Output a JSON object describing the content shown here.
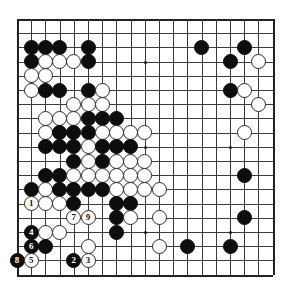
{
  "app": {
    "title": "Go Board Diagram",
    "board_size": 19,
    "colors": {
      "black": "#0d0d0d",
      "white": "#ffffff",
      "line": "#3b3b3b",
      "background": "#ffffff"
    }
  },
  "board": {
    "origin_x": 7,
    "origin_y": 7,
    "spacing": 14.2,
    "columns": 19,
    "rows": 19,
    "star_points": [
      {
        "col": 4,
        "row": 4
      },
      {
        "col": 10,
        "row": 4
      },
      {
        "col": 16,
        "row": 4
      },
      {
        "col": 4,
        "row": 10
      },
      {
        "col": 10,
        "row": 10
      },
      {
        "col": 16,
        "row": 10
      },
      {
        "col": 4,
        "row": 16
      },
      {
        "col": 10,
        "row": 16
      },
      {
        "col": 16,
        "row": 16
      }
    ]
  },
  "stones": [
    {
      "col": 2,
      "row": 3,
      "color": "black",
      "label": ""
    },
    {
      "col": 3,
      "row": 3,
      "color": "black",
      "label": ""
    },
    {
      "col": 4,
      "row": 3,
      "color": "black",
      "label": ""
    },
    {
      "col": 6,
      "row": 3,
      "color": "black",
      "label": ""
    },
    {
      "col": 14,
      "row": 3,
      "color": "black",
      "label": ""
    },
    {
      "col": 17,
      "row": 3,
      "color": "black",
      "label": ""
    },
    {
      "col": 2,
      "row": 4,
      "color": "black",
      "label": ""
    },
    {
      "col": 3,
      "row": 4,
      "color": "white",
      "label": ""
    },
    {
      "col": 4,
      "row": 4,
      "color": "white",
      "label": ""
    },
    {
      "col": 5,
      "row": 4,
      "color": "white",
      "label": ""
    },
    {
      "col": 6,
      "row": 4,
      "color": "black",
      "label": ""
    },
    {
      "col": 16,
      "row": 4,
      "color": "black",
      "label": ""
    },
    {
      "col": 18,
      "row": 4,
      "color": "white",
      "label": ""
    },
    {
      "col": 2,
      "row": 5,
      "color": "white",
      "label": ""
    },
    {
      "col": 3,
      "row": 5,
      "color": "white",
      "label": ""
    },
    {
      "col": 2,
      "row": 6,
      "color": "white",
      "label": ""
    },
    {
      "col": 3,
      "row": 6,
      "color": "black",
      "label": ""
    },
    {
      "col": 4,
      "row": 6,
      "color": "black",
      "label": ""
    },
    {
      "col": 6,
      "row": 6,
      "color": "black",
      "label": ""
    },
    {
      "col": 7,
      "row": 6,
      "color": "white",
      "label": ""
    },
    {
      "col": 16,
      "row": 6,
      "color": "black",
      "label": ""
    },
    {
      "col": 17,
      "row": 6,
      "color": "white",
      "label": ""
    },
    {
      "col": 5,
      "row": 7,
      "color": "white",
      "label": ""
    },
    {
      "col": 6,
      "row": 7,
      "color": "white",
      "label": ""
    },
    {
      "col": 7,
      "row": 7,
      "color": "white",
      "label": ""
    },
    {
      "col": 18,
      "row": 7,
      "color": "white",
      "label": ""
    },
    {
      "col": 3,
      "row": 8,
      "color": "white",
      "label": ""
    },
    {
      "col": 4,
      "row": 8,
      "color": "white",
      "label": ""
    },
    {
      "col": 5,
      "row": 8,
      "color": "white",
      "label": ""
    },
    {
      "col": 6,
      "row": 8,
      "color": "black",
      "label": ""
    },
    {
      "col": 7,
      "row": 8,
      "color": "black",
      "label": ""
    },
    {
      "col": 8,
      "row": 8,
      "color": "black",
      "label": ""
    },
    {
      "col": 3,
      "row": 9,
      "color": "white",
      "label": ""
    },
    {
      "col": 4,
      "row": 9,
      "color": "black",
      "label": ""
    },
    {
      "col": 5,
      "row": 9,
      "color": "black",
      "label": ""
    },
    {
      "col": 6,
      "row": 9,
      "color": "black",
      "label": ""
    },
    {
      "col": 7,
      "row": 9,
      "color": "white",
      "label": ""
    },
    {
      "col": 8,
      "row": 9,
      "color": "white",
      "label": ""
    },
    {
      "col": 9,
      "row": 9,
      "color": "white",
      "label": ""
    },
    {
      "col": 10,
      "row": 9,
      "color": "white",
      "label": ""
    },
    {
      "col": 17,
      "row": 9,
      "color": "white",
      "label": ""
    },
    {
      "col": 3,
      "row": 10,
      "color": "black",
      "label": ""
    },
    {
      "col": 4,
      "row": 10,
      "color": "black",
      "label": ""
    },
    {
      "col": 5,
      "row": 10,
      "color": "black",
      "label": ""
    },
    {
      "col": 6,
      "row": 10,
      "color": "white",
      "label": ""
    },
    {
      "col": 7,
      "row": 10,
      "color": "black",
      "label": ""
    },
    {
      "col": 8,
      "row": 10,
      "color": "black",
      "label": ""
    },
    {
      "col": 9,
      "row": 10,
      "color": "black",
      "label": ""
    },
    {
      "col": 5,
      "row": 11,
      "color": "black",
      "label": ""
    },
    {
      "col": 6,
      "row": 11,
      "color": "white",
      "label": ""
    },
    {
      "col": 7,
      "row": 11,
      "color": "black",
      "label": ""
    },
    {
      "col": 8,
      "row": 11,
      "color": "white",
      "label": ""
    },
    {
      "col": 9,
      "row": 11,
      "color": "white",
      "label": ""
    },
    {
      "col": 10,
      "row": 11,
      "color": "white",
      "label": ""
    },
    {
      "col": 3,
      "row": 12,
      "color": "black",
      "label": ""
    },
    {
      "col": 4,
      "row": 12,
      "color": "black",
      "label": ""
    },
    {
      "col": 5,
      "row": 12,
      "color": "white",
      "label": ""
    },
    {
      "col": 6,
      "row": 12,
      "color": "white",
      "label": ""
    },
    {
      "col": 7,
      "row": 12,
      "color": "white",
      "label": ""
    },
    {
      "col": 8,
      "row": 12,
      "color": "white",
      "label": ""
    },
    {
      "col": 9,
      "row": 12,
      "color": "white",
      "label": ""
    },
    {
      "col": 10,
      "row": 12,
      "color": "white",
      "label": ""
    },
    {
      "col": 17,
      "row": 12,
      "color": "black",
      "label": ""
    },
    {
      "col": 2,
      "row": 13,
      "color": "black",
      "label": ""
    },
    {
      "col": 3,
      "row": 13,
      "color": "white",
      "label": ""
    },
    {
      "col": 4,
      "row": 13,
      "color": "black",
      "label": ""
    },
    {
      "col": 5,
      "row": 13,
      "color": "black",
      "label": ""
    },
    {
      "col": 6,
      "row": 13,
      "color": "black",
      "label": ""
    },
    {
      "col": 7,
      "row": 13,
      "color": "black",
      "label": ""
    },
    {
      "col": 8,
      "row": 13,
      "color": "white",
      "label": ""
    },
    {
      "col": 9,
      "row": 13,
      "color": "white",
      "label": ""
    },
    {
      "col": 10,
      "row": 13,
      "color": "white",
      "label": ""
    },
    {
      "col": 11,
      "row": 13,
      "color": "white",
      "label": ""
    },
    {
      "col": 2,
      "row": 14,
      "color": "white",
      "label": "1"
    },
    {
      "col": 3,
      "row": 14,
      "color": "white",
      "label": ""
    },
    {
      "col": 4,
      "row": 14,
      "color": "white",
      "label": ""
    },
    {
      "col": 5,
      "row": 14,
      "color": "black",
      "label": ""
    },
    {
      "col": 8,
      "row": 14,
      "color": "black",
      "label": ""
    },
    {
      "col": 9,
      "row": 14,
      "color": "black",
      "label": ""
    },
    {
      "col": 5,
      "row": 15,
      "color": "white",
      "label": "7"
    },
    {
      "col": 6,
      "row": 15,
      "color": "white",
      "label": "9"
    },
    {
      "col": 8,
      "row": 15,
      "color": "black",
      "label": ""
    },
    {
      "col": 9,
      "row": 15,
      "color": "white",
      "label": ""
    },
    {
      "col": 11,
      "row": 15,
      "color": "white",
      "label": ""
    },
    {
      "col": 17,
      "row": 15,
      "color": "black",
      "label": ""
    },
    {
      "col": 2,
      "row": 16,
      "color": "black",
      "label": "4"
    },
    {
      "col": 3,
      "row": 16,
      "color": "white",
      "label": ""
    },
    {
      "col": 4,
      "row": 16,
      "color": "white",
      "label": ""
    },
    {
      "col": 8,
      "row": 16,
      "color": "black",
      "label": ""
    },
    {
      "col": 2,
      "row": 17,
      "color": "black",
      "label": "6"
    },
    {
      "col": 3,
      "row": 17,
      "color": "black",
      "label": ""
    },
    {
      "col": 6,
      "row": 17,
      "color": "white",
      "label": ""
    },
    {
      "col": 11,
      "row": 17,
      "color": "white",
      "label": ""
    },
    {
      "col": 13,
      "row": 17,
      "color": "black",
      "label": ""
    },
    {
      "col": 16,
      "row": 17,
      "color": "black",
      "label": ""
    },
    {
      "col": 1,
      "row": 18,
      "color": "black",
      "label": "8"
    },
    {
      "col": 2,
      "row": 18,
      "color": "white",
      "label": "5"
    },
    {
      "col": 5,
      "row": 18,
      "color": "black",
      "label": "2"
    },
    {
      "col": 6,
      "row": 18,
      "color": "white",
      "label": "3"
    }
  ],
  "markers": [
    {
      "col": 2,
      "row": 13,
      "text": "A"
    }
  ]
}
